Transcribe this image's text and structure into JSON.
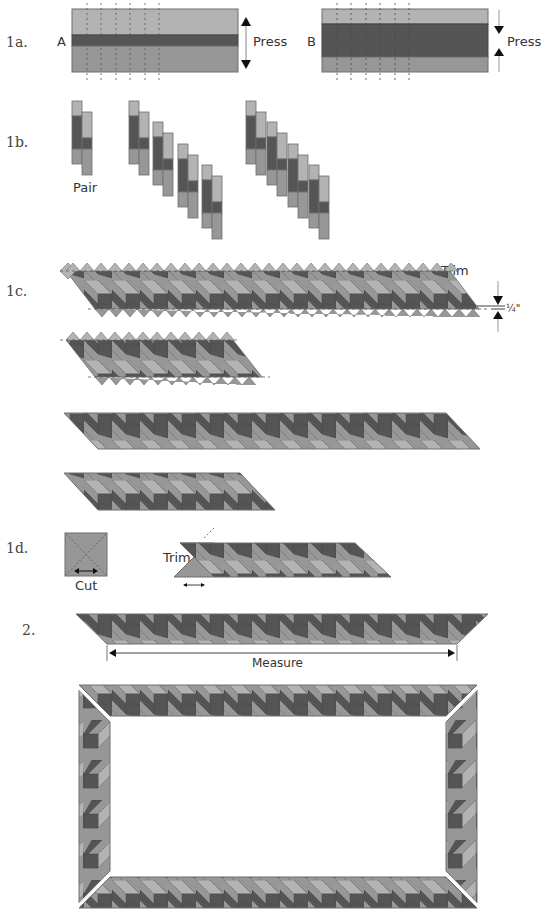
{
  "colors": {
    "light": "#b3b3b3",
    "medium": "#979797",
    "dark": "#555555",
    "outline": "#6e6e6e",
    "background": "#ffffff"
  },
  "steps": {
    "s1a": "1a.",
    "s1b": "1b.",
    "s1c": "1c.",
    "s1d": "1d.",
    "s2": "2."
  },
  "labels": {
    "strip_a": "A",
    "strip_b": "B",
    "press_a": "Press",
    "press_b": "Press",
    "pair": "Pair",
    "trim_1c": "Trim",
    "quarter_inch": "¼\"",
    "cut": "Cut",
    "trim_1d": "Trim",
    "measure": "Measure"
  }
}
